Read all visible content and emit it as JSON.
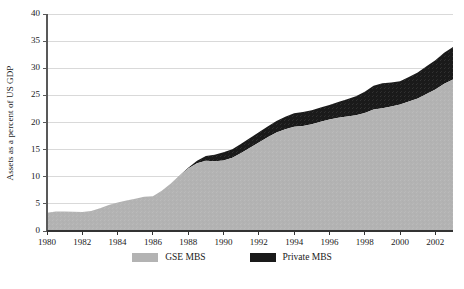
{
  "axes": {
    "ylabel": "Assets as a percent of US GDP",
    "yticks": [
      "0",
      "5",
      "10",
      "15",
      "20",
      "25",
      "30",
      "35",
      "40"
    ],
    "xticks": [
      "1980",
      "1982",
      "1984",
      "1986",
      "1988",
      "1990",
      "1992",
      "1994",
      "1996",
      "1998",
      "2000",
      "2002"
    ]
  },
  "legend": {
    "items": [
      {
        "label": "GSE MBS",
        "color": "#b3b3b3"
      },
      {
        "label": "Private MBS",
        "color": "#1a1a1a"
      }
    ]
  },
  "colors": {
    "gse": "#b3b3b3",
    "private": "#1a1a1a",
    "grid": "#d9d9d9",
    "axis": "#4d4d4d",
    "text": "#1a1a1a",
    "background": "#ffffff"
  },
  "chart_data": {
    "type": "area",
    "stacked": true,
    "title": "",
    "xlabel": "",
    "ylabel": "Assets as a percent of US GDP",
    "xlim": [
      1980,
      2003
    ],
    "ylim": [
      0,
      40
    ],
    "grid": true,
    "legend_position": "bottom-center",
    "x": [
      1980,
      1980.5,
      1981,
      1981.5,
      1982,
      1982.5,
      1983,
      1983.5,
      1984,
      1984.5,
      1985,
      1985.5,
      1986,
      1986.5,
      1987,
      1987.5,
      1988,
      1988.5,
      1989,
      1989.5,
      1990,
      1990.5,
      1991,
      1991.5,
      1992,
      1992.5,
      1993,
      1993.5,
      1994,
      1994.5,
      1995,
      1995.5,
      1996,
      1996.5,
      1997,
      1997.5,
      1998,
      1998.5,
      1999,
      1999.5,
      2000,
      2000.5,
      2001,
      2001.5,
      2002,
      2002.5,
      2003
    ],
    "series": [
      {
        "name": "GSE MBS",
        "color": "#b3b3b3",
        "values": [
          3.5,
          3.6,
          3.7,
          3.6,
          3.6,
          3.8,
          4.2,
          4.7,
          5.2,
          5.6,
          5.9,
          6.2,
          6.4,
          7.4,
          8.8,
          10.3,
          11.6,
          12.6,
          13.0,
          13.0,
          13.1,
          13.6,
          14.3,
          15.2,
          16.2,
          17.2,
          18.0,
          18.6,
          19.1,
          19.5,
          19.8,
          20.2,
          20.6,
          20.9,
          21.2,
          21.5,
          21.9,
          22.3,
          22.6,
          22.9,
          23.3,
          23.8,
          24.3,
          25.2,
          26.2,
          27.2,
          28.0
        ]
      },
      {
        "name": "Private MBS",
        "color": "#1a1a1a",
        "values": [
          0.0,
          0.0,
          0.0,
          0.0,
          0.0,
          0.0,
          0.0,
          0.0,
          0.0,
          0.0,
          0.0,
          0.0,
          0.0,
          0.0,
          0.0,
          0.05,
          0.15,
          0.45,
          0.9,
          1.2,
          1.5,
          1.6,
          1.7,
          1.8,
          1.9,
          2.0,
          2.1,
          2.3,
          2.5,
          2.6,
          2.6,
          2.6,
          2.7,
          2.9,
          3.2,
          3.5,
          3.9,
          4.4,
          4.6,
          4.4,
          4.3,
          4.5,
          4.8,
          5.1,
          5.4,
          5.7,
          6.0
        ]
      }
    ],
    "totals": [
      3.5,
      3.6,
      3.7,
      3.6,
      3.6,
      3.8,
      4.2,
      4.7,
      5.2,
      5.6,
      5.9,
      6.2,
      6.4,
      7.4,
      8.8,
      10.35,
      11.75,
      13.05,
      13.9,
      14.2,
      14.6,
      15.2,
      16.0,
      17.0,
      18.1,
      19.2,
      20.1,
      20.9,
      21.6,
      22.1,
      22.4,
      22.8,
      23.3,
      23.8,
      24.4,
      25.0,
      25.8,
      26.7,
      27.2,
      27.3,
      27.6,
      28.3,
      29.1,
      30.3,
      31.6,
      32.9,
      34.0
    ]
  }
}
